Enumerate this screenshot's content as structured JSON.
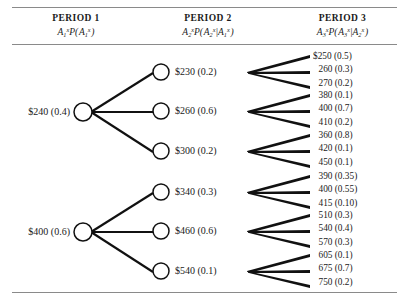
{
  "figure": {
    "rules": [
      "top-rule",
      "header-rule",
      "bottom-rule"
    ]
  },
  "headers": [
    {
      "title": "PERIOD 1",
      "formula_plain": "A1x P( A1x )",
      "symbol": "A",
      "sub": "1",
      "sup": "x",
      "cond_sub": "1",
      "cond_sup": "x"
    },
    {
      "title": "PERIOD 2",
      "formula_plain": "A2x P( A2x | A1x )",
      "symbol": "A",
      "sub": "2",
      "sup": "x",
      "cond_sub": "2",
      "cond_sup": "x",
      "given_sub": "1",
      "given_sup": "x"
    },
    {
      "title": "PERIOD 3",
      "formula_plain": "A3x P( A3x | A2x )",
      "symbol": "A",
      "sub": "3",
      "sup": "x",
      "cond_sub": "3",
      "cond_sup": "x",
      "given_sub": "2",
      "given_sup": "x"
    }
  ],
  "tree_data": {
    "type": "decision-tree",
    "period1": [
      {
        "label": "$240 (0.4)",
        "value": 240,
        "probability": 0.4
      },
      {
        "label": "$400 (0.6)",
        "value": 400,
        "probability": 0.6
      }
    ],
    "period2": [
      {
        "label": "$230 (0.2)",
        "value": 230,
        "probability": 0.2,
        "parent": 0
      },
      {
        "label": "$260 (0.6)",
        "value": 260,
        "probability": 0.6,
        "parent": 0
      },
      {
        "label": "$300 (0.2)",
        "value": 300,
        "probability": 0.2,
        "parent": 0
      },
      {
        "label": "$340 (0.3)",
        "value": 340,
        "probability": 0.3,
        "parent": 1
      },
      {
        "label": "$460 (0.6)",
        "value": 460,
        "probability": 0.6,
        "parent": 1
      },
      {
        "label": "$540 (0.1)",
        "value": 540,
        "probability": 0.1,
        "parent": 1
      }
    ],
    "period3": [
      {
        "parent": 0,
        "rows": [
          {
            "label": "$250 (0.5)",
            "value": 250,
            "probability": 0.5
          },
          {
            "label": "260 (0.3)",
            "value": 260,
            "probability": 0.3
          },
          {
            "label": "270 (0.2)",
            "value": 270,
            "probability": 0.2
          }
        ]
      },
      {
        "parent": 1,
        "rows": [
          {
            "label": "380 (0.1)",
            "value": 380,
            "probability": 0.1
          },
          {
            "label": "400 (0.7)",
            "value": 400,
            "probability": 0.7
          },
          {
            "label": "410 (0.2)",
            "value": 410,
            "probability": 0.2
          }
        ]
      },
      {
        "parent": 2,
        "rows": [
          {
            "label": "360 (0.8)",
            "value": 360,
            "probability": 0.8
          },
          {
            "label": "420 (0.1)",
            "value": 420,
            "probability": 0.1
          },
          {
            "label": "450 (0.1)",
            "value": 450,
            "probability": 0.1
          }
        ]
      },
      {
        "parent": 3,
        "rows": [
          {
            "label": "390 (0.35)",
            "value": 390,
            "probability": 0.35
          },
          {
            "label": "400 (0.55)",
            "value": 400,
            "probability": 0.55
          },
          {
            "label": "415 (0.10)",
            "value": 415,
            "probability": 0.1
          }
        ]
      },
      {
        "parent": 4,
        "rows": [
          {
            "label": "510 (0.3)",
            "value": 510,
            "probability": 0.3
          },
          {
            "label": "540 (0.4)",
            "value": 540,
            "probability": 0.4
          },
          {
            "label": "570 (0.3)",
            "value": 570,
            "probability": 0.3
          }
        ]
      },
      {
        "parent": 5,
        "rows": [
          {
            "label": "605 (0.1)",
            "value": 605,
            "probability": 0.1
          },
          {
            "label": "675 (0.7)",
            "value": 675,
            "probability": 0.7
          },
          {
            "label": "750 (0.2)",
            "value": 750,
            "probability": 0.2
          }
        ]
      }
    ]
  }
}
